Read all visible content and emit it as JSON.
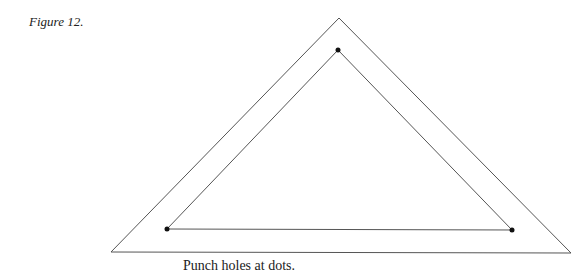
{
  "figure": {
    "label": "Figure 12.",
    "caption": "Punch holes at dots."
  },
  "diagram": {
    "shapes": [
      {
        "name": "outer-triangle",
        "type": "triangle-outline"
      },
      {
        "name": "inner-triangle",
        "type": "triangle-outline"
      }
    ],
    "dots": [
      {
        "name": "dot-top",
        "meaning": "punch hole"
      },
      {
        "name": "dot-left",
        "meaning": "punch hole"
      },
      {
        "name": "dot-right",
        "meaning": "punch hole"
      }
    ],
    "colors": {
      "line": "#555555",
      "dot": "#111111"
    }
  }
}
